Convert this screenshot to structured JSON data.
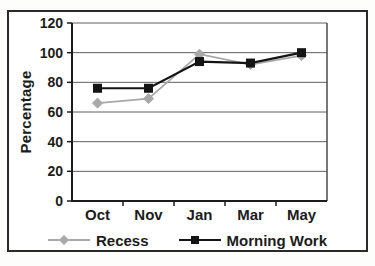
{
  "chart_data": {
    "type": "line",
    "categories": [
      "Oct",
      "Nov",
      "Jan",
      "Mar",
      "May"
    ],
    "series": [
      {
        "name": "Recess",
        "values": [
          66,
          69,
          99,
          92,
          98
        ],
        "color": "#a8a8a8",
        "marker": "diamond"
      },
      {
        "name": "Morning Work",
        "values": [
          76,
          76,
          94,
          93,
          100
        ],
        "color": "#141414",
        "marker": "square"
      }
    ],
    "title": "",
    "xlabel": "",
    "ylabel": "Percentage",
    "ylim": [
      0,
      120
    ],
    "ytick_step": 20,
    "yticks": [
      0,
      20,
      40,
      60,
      80,
      100,
      120
    ],
    "grid": true,
    "legend_position": "bottom"
  },
  "colors": {
    "frame_border": "#2a2a2a",
    "axis": "#1c1c1c",
    "gridline": "#5f5f5f",
    "plot_border": "#4a4a4a",
    "text": "#1c1c1c",
    "background": "#ffffff"
  }
}
